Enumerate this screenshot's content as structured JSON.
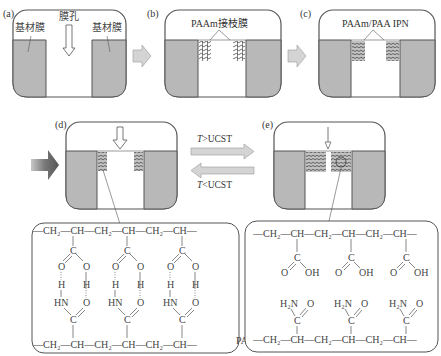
{
  "panels": {
    "a": {
      "label": "(a)",
      "left_text": "基材膜",
      "center_text": "膜孔",
      "right_text": "基材膜"
    },
    "b": {
      "label": "(b)",
      "title": "PAAm接枝膜"
    },
    "c": {
      "label": "(c)",
      "title": "PAAm/PAA IPN"
    },
    "d": {
      "label": "(d)"
    },
    "e": {
      "label": "(e)"
    }
  },
  "transition": {
    "forward_label_T": "T",
    "forward_label_op": ">UCST",
    "backward_label_T": "T",
    "backward_label_op": "<UCST"
  },
  "left_structure": {
    "top_chain": "—CH₂—CH—CH₂—CH—CH₂—CH—",
    "bottom_chain": "—CH₂—CH—CH₂—CH—CH₂—CH—",
    "top_label": "PAA",
    "bottom_label": "PAAm",
    "atoms": {
      "C": "C",
      "O": "O",
      "H": "H",
      "HN": "HN"
    }
  },
  "right_structure": {
    "top_chain": "—CH₂—CH—CH₂—CH—CH₂—CH—",
    "bottom_chain": "—CH₂—CH—CH₂—CH—CH₂—CH—",
    "atoms": {
      "C": "C",
      "O": "O",
      "OH": "OH",
      "H2N": "H₂N"
    }
  },
  "colors": {
    "membrane_fill": "#b8b8b8",
    "outline": "#555555",
    "arrow_fill": "#d4d4d4",
    "dark_arrow": "#6a6a6a"
  }
}
